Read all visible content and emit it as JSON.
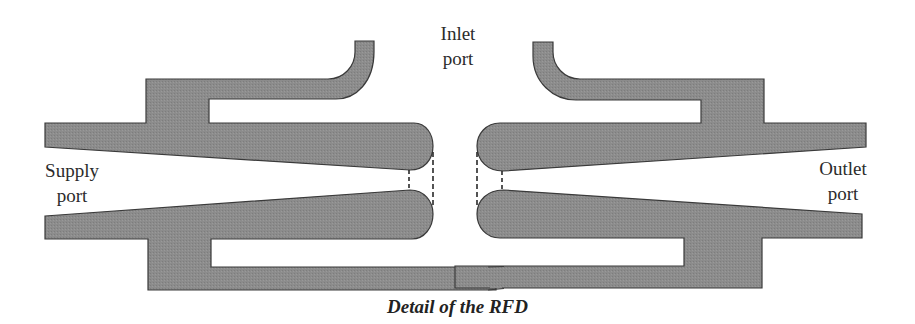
{
  "figure": {
    "title": "Detail of the RFD",
    "labels": {
      "inlet": [
        "Inlet",
        "port"
      ],
      "supply": [
        "Supply",
        "port"
      ],
      "outlet": [
        "Outlet",
        "port"
      ]
    },
    "colors": {
      "body_fill": "#8a8a8a",
      "outline": "#3a3a3a",
      "background": "#ffffff",
      "text": "#2b2b2b"
    },
    "components": [
      "left-upper-body-with-inlet-hook",
      "left-lower-body",
      "right-upper-body-with-inlet-hook",
      "right-lower-body",
      "left-throat-dashed-lines",
      "right-throat-dashed-lines"
    ]
  }
}
